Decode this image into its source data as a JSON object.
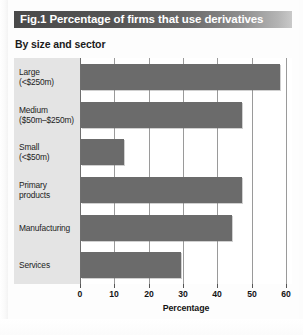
{
  "figure": {
    "title": "Fig.1 Percentage of firms that use derivatives",
    "subtitle": "By size and sector",
    "accent_color": "#4a4a4a",
    "bar_color": "#6b6b6b",
    "label_panel_color": "#e4e4e4"
  },
  "chart_data": {
    "type": "bar",
    "orientation": "horizontal",
    "title": "Fig.1 Percentage of firms that use derivatives",
    "subtitle": "By size and sector",
    "categories": [
      "Large (<$250m)",
      "Medium ($50m–$250m)",
      "Small (<$50m)",
      "Primary products",
      "Manufacturing",
      "Services"
    ],
    "category_lines": [
      [
        "Large",
        "(<$250m)"
      ],
      [
        "Medium",
        "($50m–$250m)"
      ],
      [
        "Small",
        "(<$50m)"
      ],
      [
        "Primary",
        "products"
      ],
      [
        "Manufacturing",
        ""
      ],
      [
        "Services",
        ""
      ]
    ],
    "values": [
      58,
      47,
      12.5,
      47,
      44,
      29
    ],
    "xlabel": "Percentage",
    "ylabel": "",
    "xlim": [
      0,
      60
    ],
    "xticks": [
      0,
      10,
      20,
      30,
      40,
      50,
      60
    ],
    "xtick_labels": [
      "0",
      "10",
      "20",
      "30",
      "40",
      "50",
      "60"
    ],
    "grid": true,
    "legend": false
  }
}
